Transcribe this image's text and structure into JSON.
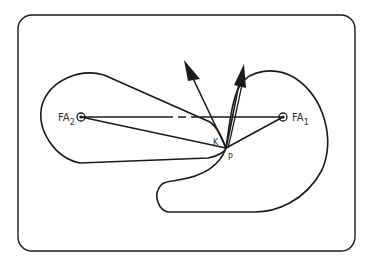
{
  "diagram": {
    "labels": {
      "focus_left": "FA",
      "focus_left_sub": "2",
      "focus_right": "FA",
      "focus_right_sub": "1",
      "point_k": "K",
      "point_p": "P"
    },
    "colors": {
      "stroke": "#1a1a1a",
      "background": "#ffffff"
    }
  }
}
